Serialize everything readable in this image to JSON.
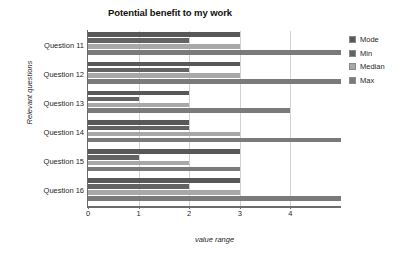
{
  "chart_data": {
    "type": "bar",
    "orientation": "horizontal",
    "title": "Potential benefit to my work",
    "xlabel": "value range",
    "ylabel": "Relevant questions",
    "categories": [
      "Question 11",
      "Question 12",
      "Question 13",
      "Question 14",
      "Question 15",
      "Question 16"
    ],
    "series": [
      {
        "name": "Mode",
        "color": "#585858",
        "values": [
          3,
          3,
          2,
          2,
          3,
          3
        ]
      },
      {
        "name": "Min",
        "color": "#636363",
        "values": [
          2,
          2,
          1,
          2,
          1,
          2
        ]
      },
      {
        "name": "Median",
        "color": "#a8a8a8",
        "values": [
          3,
          3,
          2,
          3,
          2,
          3
        ]
      },
      {
        "name": "Max",
        "color": "#7a7a7a",
        "values": [
          5,
          5,
          4,
          5,
          3,
          5
        ]
      }
    ],
    "xlim": [
      0,
      5
    ],
    "xticks": [
      0,
      1,
      2,
      3,
      4
    ],
    "xtick_labels": [
      "0",
      "1",
      "2",
      "3",
      "4"
    ],
    "grid": "vertical",
    "legend_position": "right",
    "legend_entries": [
      "Mode",
      "Min",
      "Median",
      "Max"
    ]
  }
}
